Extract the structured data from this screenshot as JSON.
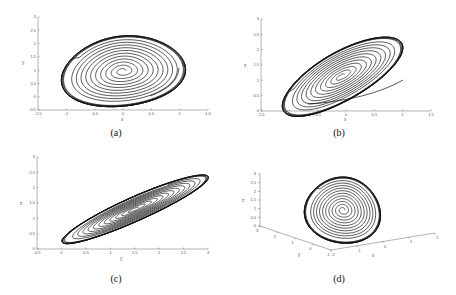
{
  "chart_data": [
    {
      "id": "a",
      "type": "line",
      "caption": "(a)",
      "title": "",
      "xlabel": "x",
      "ylabel": "y",
      "xlim": [
        -1.5,
        1.5
      ],
      "ylim": [
        -0.5,
        3
      ],
      "xticks": [
        "-1.5",
        "-1",
        "-0.5",
        "0",
        "0.5",
        "1",
        "1.5"
      ],
      "yticks": [
        "-0.5",
        "0",
        "0.5",
        "1",
        "1.5",
        "2",
        "2.5",
        "3"
      ],
      "grid": false,
      "description": "Phase portrait: trajectory starting near (1, 0.95) spirals outward to a limit cycle; inner spiral around equilibrium (0, 0.95)",
      "equilibrium": [
        0,
        0.95
      ],
      "limit_cycle_extent": {
        "x": [
          -1.35,
          0.95
        ],
        "y": [
          0.0,
          2.8
        ]
      }
    },
    {
      "id": "b",
      "type": "line",
      "caption": "(b)",
      "xlabel": "x",
      "ylabel": "z",
      "xlim": [
        -1.5,
        1.5
      ],
      "ylim": [
        0,
        3
      ],
      "xticks": [
        "-1.5",
        "-1",
        "-0.5",
        "0",
        "0.5",
        "1",
        "1.5"
      ],
      "yticks": [
        "0",
        "0.5",
        "1",
        "1.5",
        "2",
        "2.5",
        "3"
      ],
      "grid": false,
      "description": "Phase portrait in x-z plane, tilted elliptical limit cycle with inner spiral around (0, 0.95)",
      "equilibrium": [
        0,
        0.95
      ],
      "limit_cycle_extent": {
        "x": [
          -1.35,
          0.95
        ],
        "y": [
          0.2,
          2.6
        ]
      }
    },
    {
      "id": "c",
      "type": "line",
      "caption": "(c)",
      "xlabel": "y",
      "ylabel": "z",
      "xlim": [
        -0.5,
        3
      ],
      "ylim": [
        0,
        3
      ],
      "xticks": [
        "-0.5",
        "0",
        "0.5",
        "1",
        "1.5",
        "2",
        "2.5",
        "3"
      ],
      "yticks": [
        "0",
        "0.5",
        "1",
        "1.5",
        "2",
        "2.5",
        "3"
      ],
      "grid": false,
      "description": "Phase portrait in y-z plane, narrow diagonal elliptical limit cycle with spiral around (0.95, 0.95)",
      "equilibrium": [
        0.95,
        0.95
      ],
      "limit_cycle_extent": {
        "x": [
          0.0,
          2.8
        ],
        "y": [
          0.3,
          2.6
        ]
      }
    },
    {
      "id": "d",
      "type": "line",
      "caption": "(d)",
      "xlabel": "x",
      "ylabel": "y",
      "zlabel": "z",
      "projection": "3d",
      "xticks": [
        "-2",
        "-1",
        "0",
        "1",
        "2"
      ],
      "yticks": [
        "3",
        "2",
        "1",
        "0",
        "-1"
      ],
      "zticks": [
        "0",
        "0.5",
        "1",
        "1.5",
        "2",
        "2.5",
        "3"
      ],
      "grid": false,
      "description": "3D trajectory in x-y-z space spiraling out to a limit cycle"
    }
  ]
}
